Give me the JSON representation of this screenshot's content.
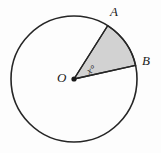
{
  "figure": {
    "kind": "circle-sector-diagram",
    "background_color": "#fdfdfd",
    "stroke_color": "#262626",
    "sector_fill_color": "#d2d2d2",
    "labels": {
      "center": "O",
      "point_a": "A",
      "point_b": "B",
      "angle": "x°"
    }
  },
  "chart_data": {
    "type": "diagram",
    "title": "",
    "shapes": [
      {
        "name": "circle",
        "center_label": "O",
        "center_x": 74,
        "center_y": 79,
        "radius": 63,
        "fill": "none",
        "stroke": "#262626",
        "stroke_width": 1.6
      },
      {
        "name": "sector-AOB",
        "fill": "#d2d2d2",
        "stroke": "#262626",
        "stroke_width": 1.4,
        "start_angle_deg": 12.5,
        "end_angle_deg": 57.7,
        "central_angle_label": "x°"
      },
      {
        "name": "center-dot",
        "x": 74,
        "y": 79,
        "radius": 2.6,
        "fill": "#1a1a1a"
      }
    ],
    "points": [
      {
        "label": "O",
        "role": "center",
        "x": 74,
        "y": 79
      },
      {
        "label": "A",
        "role": "on-circle",
        "x": 110,
        "y": 22
      },
      {
        "label": "B",
        "role": "on-circle",
        "x": 137,
        "y": 65
      }
    ],
    "segments": [
      {
        "from": "O",
        "to": "A",
        "name": "radius-OA"
      },
      {
        "from": "O",
        "to": "B",
        "name": "radius-OB"
      }
    ],
    "annotations": [
      {
        "name": "angle-x",
        "text": "x°",
        "at_x": 85,
        "at_y": 68,
        "rotation_deg": -31
      }
    ]
  }
}
